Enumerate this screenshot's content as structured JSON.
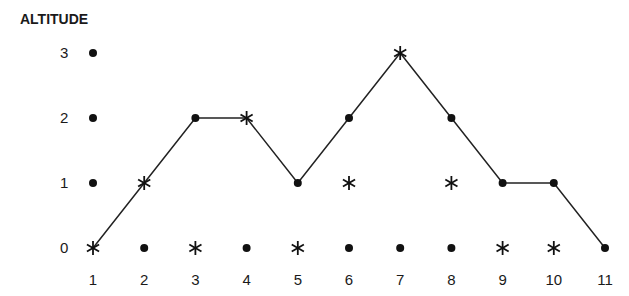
{
  "title": "ALTITUDE",
  "y_ticks": [
    "0",
    "1",
    "2",
    "3"
  ],
  "x_ticks": [
    "1",
    "2",
    "3",
    "4",
    "5",
    "6",
    "7",
    "8",
    "9",
    "10",
    "11"
  ],
  "chart_data": {
    "type": "line",
    "title": "",
    "ylabel": "ALTITUDE",
    "xlabel": "",
    "x": [
      1,
      2,
      3,
      4,
      5,
      6,
      7,
      8,
      9,
      10,
      11
    ],
    "ylim": [
      0,
      3
    ],
    "grid": false,
    "series": [
      {
        "name": "path",
        "values": [
          0,
          1,
          2,
          2,
          1,
          2,
          3,
          2,
          1,
          1,
          0
        ],
        "markers": [
          "star",
          "star",
          "dot",
          "star",
          "dot",
          "dot",
          "star",
          "dot",
          "dot",
          "dot",
          "dot"
        ]
      }
    ],
    "unconnected_points": [
      {
        "x": 1,
        "y": 3,
        "marker": "dot"
      },
      {
        "x": 1,
        "y": 2,
        "marker": "dot"
      },
      {
        "x": 1,
        "y": 1,
        "marker": "dot"
      },
      {
        "x": 2,
        "y": 0,
        "marker": "dot"
      },
      {
        "x": 3,
        "y": 0,
        "marker": "star"
      },
      {
        "x": 4,
        "y": 0,
        "marker": "dot"
      },
      {
        "x": 5,
        "y": 0,
        "marker": "star"
      },
      {
        "x": 6,
        "y": 0,
        "marker": "dot"
      },
      {
        "x": 6,
        "y": 1,
        "marker": "star"
      },
      {
        "x": 7,
        "y": 0,
        "marker": "dot"
      },
      {
        "x": 8,
        "y": 0,
        "marker": "dot"
      },
      {
        "x": 8,
        "y": 1,
        "marker": "star"
      },
      {
        "x": 9,
        "y": 0,
        "marker": "star"
      },
      {
        "x": 10,
        "y": 0,
        "marker": "star"
      }
    ]
  }
}
